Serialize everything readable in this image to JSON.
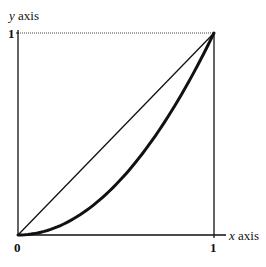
{
  "chart_data": {
    "type": "line",
    "title": "",
    "xlabel": "x axis",
    "ylabel": "y axis",
    "xlabel_var": "x",
    "xlabel_word": "axis",
    "ylabel_var": "y",
    "ylabel_word": "axis",
    "xlim": [
      0,
      1
    ],
    "ylim": [
      0,
      1
    ],
    "x_ticks": [
      "0",
      "1"
    ],
    "y_ticks": [
      "1"
    ],
    "grid": false,
    "legend": null,
    "series": [
      {
        "name": "diagonal (y = x)",
        "style": "thin solid",
        "x": [
          0,
          0.25,
          0.5,
          0.75,
          1
        ],
        "y": [
          0,
          0.25,
          0.5,
          0.75,
          1
        ]
      },
      {
        "name": "convex curve (approx. y = x^2)",
        "style": "thick solid",
        "x": [
          0,
          0.25,
          0.5,
          0.75,
          1
        ],
        "y": [
          0,
          0.06,
          0.25,
          0.55,
          1
        ]
      }
    ],
    "annotations": [
      {
        "type": "dotted horizontal guide",
        "from": [
          0,
          1
        ],
        "to": [
          1,
          1
        ]
      },
      {
        "type": "solid vertical line",
        "from": [
          1,
          0
        ],
        "to": [
          1,
          1
        ]
      }
    ]
  },
  "labels": {
    "y_axis_var": "y",
    "y_axis_word": " axis",
    "x_axis_var": "x",
    "x_axis_word": " axis",
    "y_tick_1": "1",
    "x_tick_0": "0",
    "x_tick_1": "1"
  },
  "colors": {
    "ink": "#111111",
    "background": "#ffffff"
  }
}
